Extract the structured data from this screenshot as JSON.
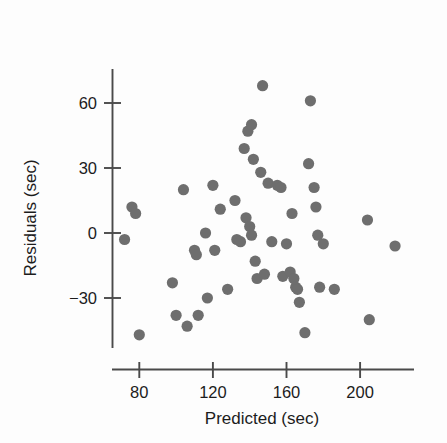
{
  "chart_data": {
    "type": "scatter",
    "title": "",
    "xlabel": "Predicted (sec)",
    "ylabel": "Residuals (sec)",
    "xlim": [
      68,
      224
    ],
    "ylim": [
      -53,
      78
    ],
    "xticks": [
      80,
      120,
      160,
      200
    ],
    "xticklabels": [
      "80",
      "120",
      "160",
      "200"
    ],
    "yticks": [
      -30,
      0,
      30,
      60
    ],
    "yticklabels": [
      "-30",
      "0",
      "30",
      "60"
    ],
    "grid": false,
    "legend": null,
    "marker": {
      "shape": "circle",
      "color": "#6e6e6e",
      "size": 5.6
    },
    "points": [
      {
        "x": 72,
        "y": -3
      },
      {
        "x": 76,
        "y": 12
      },
      {
        "x": 78,
        "y": 9
      },
      {
        "x": 80,
        "y": -47
      },
      {
        "x": 98,
        "y": -23
      },
      {
        "x": 100,
        "y": -38
      },
      {
        "x": 104,
        "y": 20
      },
      {
        "x": 106,
        "y": -43
      },
      {
        "x": 110,
        "y": -8
      },
      {
        "x": 111,
        "y": -10
      },
      {
        "x": 112,
        "y": -38
      },
      {
        "x": 116,
        "y": 0
      },
      {
        "x": 117,
        "y": -30
      },
      {
        "x": 120,
        "y": 22
      },
      {
        "x": 121,
        "y": -8
      },
      {
        "x": 124,
        "y": 11
      },
      {
        "x": 128,
        "y": -26
      },
      {
        "x": 132,
        "y": 15
      },
      {
        "x": 133,
        "y": -3
      },
      {
        "x": 135,
        "y": -4
      },
      {
        "x": 137,
        "y": 39
      },
      {
        "x": 138,
        "y": 7
      },
      {
        "x": 139,
        "y": 47
      },
      {
        "x": 140,
        "y": 3
      },
      {
        "x": 141,
        "y": 50
      },
      {
        "x": 141,
        "y": -1
      },
      {
        "x": 142,
        "y": 34
      },
      {
        "x": 143,
        "y": -13
      },
      {
        "x": 144,
        "y": -21
      },
      {
        "x": 146,
        "y": 28
      },
      {
        "x": 147,
        "y": 68
      },
      {
        "x": 148,
        "y": -19
      },
      {
        "x": 150,
        "y": 23
      },
      {
        "x": 152,
        "y": -4
      },
      {
        "x": 155,
        "y": 22
      },
      {
        "x": 157,
        "y": 21
      },
      {
        "x": 158,
        "y": -20
      },
      {
        "x": 160,
        "y": -5
      },
      {
        "x": 162,
        "y": -18
      },
      {
        "x": 163,
        "y": 9
      },
      {
        "x": 164,
        "y": -21
      },
      {
        "x": 165,
        "y": -25
      },
      {
        "x": 166,
        "y": -26
      },
      {
        "x": 167,
        "y": -32
      },
      {
        "x": 170,
        "y": -46
      },
      {
        "x": 172,
        "y": 32
      },
      {
        "x": 173,
        "y": 61
      },
      {
        "x": 175,
        "y": 21
      },
      {
        "x": 176,
        "y": 12
      },
      {
        "x": 177,
        "y": -1
      },
      {
        "x": 178,
        "y": -25
      },
      {
        "x": 180,
        "y": -5
      },
      {
        "x": 186,
        "y": -26
      },
      {
        "x": 204,
        "y": 6
      },
      {
        "x": 205,
        "y": -40
      },
      {
        "x": 219,
        "y": -6
      }
    ]
  },
  "axes": {
    "y_axis_label": "Residuals (sec)",
    "x_axis_label": "Predicted (sec)",
    "y_tick_labels": [
      "60",
      "30",
      "0",
      "-30"
    ],
    "x_tick_labels": [
      "80",
      "120",
      "160",
      "200"
    ]
  },
  "colors": {
    "marker": "#6e6e6e",
    "axis": "#4a4a4a",
    "text": "#1c1c1c",
    "background": "#fdfdfd"
  }
}
